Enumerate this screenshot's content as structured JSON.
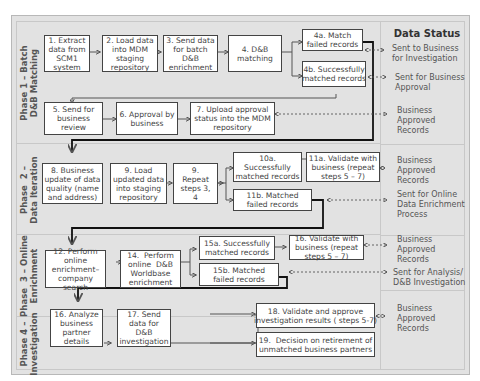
{
  "title": "Data Status",
  "phases": [
    {
      "label": "Phase 1 – Batch\nD&B Matching"
    },
    {
      "label": "Phase  2 –\nData Iteration"
    },
    {
      "label": "Phase  3 – Online\nEnrichment"
    },
    {
      "label": "Phase 4 –\nInvestigation"
    }
  ],
  "steps": {
    "s1": "1. Extract\ndata from\nSCM1\nsystem",
    "s2": "2. Load data\ninto MDM\nstaging\nrepository",
    "s3": "3. Send data\nfor batch\nD&B\nenrichment",
    "s4": "4. D&B\nmatching",
    "s4a": "4a. Match\nfailed records",
    "s4b": "4b. Successfully\nmatched records",
    "s5": "5. Send for\nbusiness\nreview",
    "s6": "6. Approval by\nbusiness",
    "s7": "7. Upload approval\nstatus into the MDM\nrepository",
    "s8": "8. Business\nupdate of data\nquality (name\nand address)",
    "s9": "9. Load\nupdated data\ninto staging\nrepository",
    "s9r": "9.\nRepeat\nsteps 3,\n4",
    "s10a": "10a.\nSuccessfully\nmatched records",
    "s11a": "11a. Validate with\nbusiness (repeat\nsteps 5 – 7)",
    "s11b": "11b. Matched\nfailed records",
    "s12": "12. Perform\nonline\nenrichment–\ncompany\nsearch",
    "s14": "14.  Perform\nonline  D&B\nWorldbase\nenrichment",
    "s15a": "15a. Successfully\nmatched records",
    "s15b": "15b. Matched\nfailed records",
    "s16v": "16. Validate with\nbusiness (repeat\nsteps 5 – 7)",
    "s16": "16. Analyze\nbusiness\npartner\ndetails",
    "s17": "17. Send\ndata for\nD&B\ninvestigation",
    "s18": "18. Validate and approve\ninvestigation results ( steps 5-7)",
    "s19": "19.  Decision on retirement of\nunmatched business partners"
  },
  "statuses": [
    "Sent to Business\nfor Investigation",
    "Sent for Business\nApproval",
    "Business\nApproved\nRecords",
    "Business\nApproved\nRecords",
    "Sent for Online\nData Enrichment\nProcess",
    "Business\nApproved\nRecords",
    "Sent for Analysis/\nD&B Investigation",
    "Business\nApproved\nRecords"
  ],
  "colors": {
    "panel": "#e2e2e2",
    "box_border": "#444444",
    "text": "#444444"
  }
}
